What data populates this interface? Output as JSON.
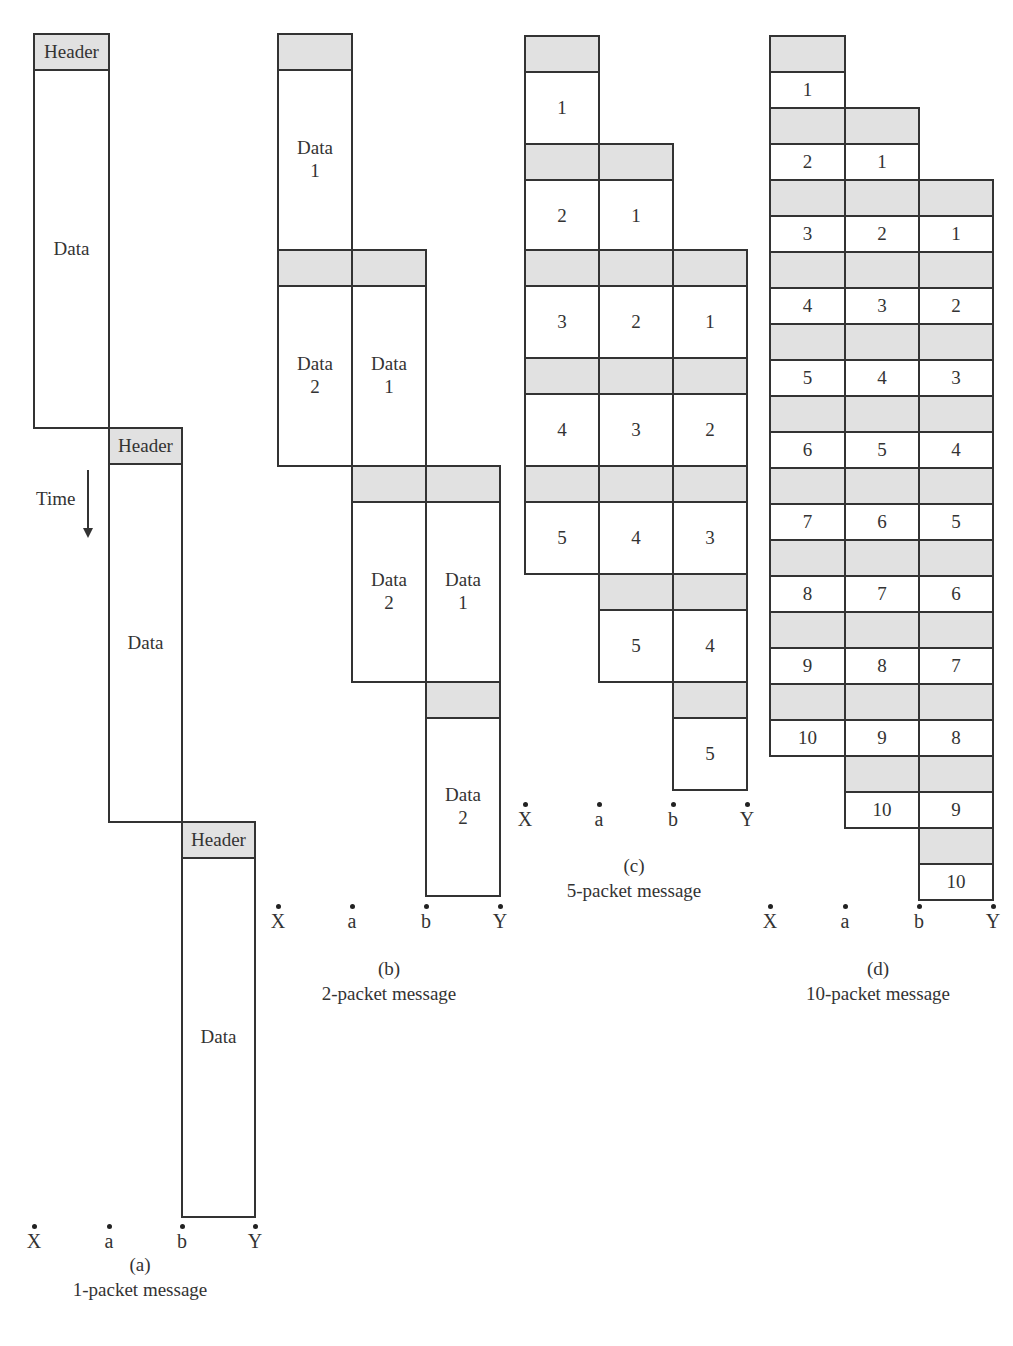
{
  "figure": {
    "colors": {
      "header_fill": "#e1e1e1",
      "data_fill": "#ffffff",
      "stroke": "#333333"
    },
    "time_label": "Time",
    "panels": [
      {
        "id": "a",
        "caption_letter": "(a)",
        "caption_text": "1-packet message",
        "nodes": [
          "X",
          "a",
          "b",
          "Y"
        ],
        "cols": [
          34,
          109,
          182,
          255
        ],
        "node_y": 1230,
        "caption_x": 40,
        "caption_w": 200,
        "caption_y": 1252,
        "cells": [
          {
            "c": 0,
            "y": 34,
            "h": 36,
            "type": "hdr",
            "text": "Header"
          },
          {
            "c": 0,
            "y": 70,
            "h": 358,
            "type": "dat",
            "text": "Data"
          },
          {
            "c": 1,
            "y": 428,
            "h": 36,
            "type": "hdr",
            "text": "Header"
          },
          {
            "c": 1,
            "y": 464,
            "h": 358,
            "type": "dat",
            "text": "Data"
          },
          {
            "c": 2,
            "y": 822,
            "h": 36,
            "type": "hdr",
            "text": "Header"
          },
          {
            "c": 2,
            "y": 858,
            "h": 359,
            "type": "dat",
            "text": "Data"
          }
        ]
      },
      {
        "id": "b",
        "caption_letter": "(b)",
        "caption_text": "2-packet message",
        "nodes": [
          "X",
          "a",
          "b",
          "Y"
        ],
        "cols": [
          278,
          352,
          426,
          500
        ],
        "node_y": 910,
        "caption_x": 289,
        "caption_w": 200,
        "caption_y": 956,
        "cells": [
          {
            "c": 0,
            "y": 34,
            "h": 36,
            "type": "hdr",
            "text": ""
          },
          {
            "c": 0,
            "y": 70,
            "h": 180,
            "type": "dat",
            "text": "Data\n1"
          },
          {
            "c": 0,
            "y": 250,
            "h": 36,
            "type": "hdr",
            "text": ""
          },
          {
            "c": 1,
            "y": 250,
            "h": 36,
            "type": "hdr",
            "text": ""
          },
          {
            "c": 0,
            "y": 286,
            "h": 180,
            "type": "dat",
            "text": "Data\n2"
          },
          {
            "c": 1,
            "y": 286,
            "h": 180,
            "type": "dat",
            "text": "Data\n1"
          },
          {
            "c": 1,
            "y": 466,
            "h": 36,
            "type": "hdr",
            "text": ""
          },
          {
            "c": 2,
            "y": 466,
            "h": 36,
            "type": "hdr",
            "text": ""
          },
          {
            "c": 1,
            "y": 502,
            "h": 180,
            "type": "dat",
            "text": "Data\n2"
          },
          {
            "c": 2,
            "y": 502,
            "h": 180,
            "type": "dat",
            "text": "Data\n1"
          },
          {
            "c": 2,
            "y": 682,
            "h": 36,
            "type": "hdr",
            "text": ""
          },
          {
            "c": 2,
            "y": 718,
            "h": 178,
            "type": "dat",
            "text": "Data\n2"
          }
        ]
      },
      {
        "id": "c",
        "caption_letter": "(c)",
        "caption_text": "5-packet message",
        "nodes": [
          "X",
          "a",
          "b",
          "Y"
        ],
        "cols": [
          525,
          599,
          673,
          747
        ],
        "node_y": 808,
        "caption_x": 534,
        "caption_w": 200,
        "caption_y": 853,
        "cells": [
          {
            "c": 0,
            "y": 36,
            "h": 36,
            "type": "hdr",
            "text": ""
          },
          {
            "c": 0,
            "y": 72,
            "h": 72,
            "type": "dat",
            "text": "1"
          },
          {
            "c": 0,
            "y": 144,
            "h": 36,
            "type": "hdr",
            "text": ""
          },
          {
            "c": 1,
            "y": 144,
            "h": 36,
            "type": "hdr",
            "text": ""
          },
          {
            "c": 0,
            "y": 180,
            "h": 72,
            "type": "dat",
            "text": "2"
          },
          {
            "c": 1,
            "y": 180,
            "h": 72,
            "type": "dat",
            "text": "1"
          },
          {
            "c": 0,
            "y": 250,
            "h": 36,
            "type": "hdr",
            "text": ""
          },
          {
            "c": 1,
            "y": 250,
            "h": 36,
            "type": "hdr",
            "text": ""
          },
          {
            "c": 2,
            "y": 250,
            "h": 36,
            "type": "hdr",
            "text": ""
          },
          {
            "c": 0,
            "y": 286,
            "h": 72,
            "type": "dat",
            "text": "3"
          },
          {
            "c": 1,
            "y": 286,
            "h": 72,
            "type": "dat",
            "text": "2"
          },
          {
            "c": 2,
            "y": 286,
            "h": 72,
            "type": "dat",
            "text": "1"
          },
          {
            "c": 0,
            "y": 358,
            "h": 36,
            "type": "hdr",
            "text": ""
          },
          {
            "c": 1,
            "y": 358,
            "h": 36,
            "type": "hdr",
            "text": ""
          },
          {
            "c": 2,
            "y": 358,
            "h": 36,
            "type": "hdr",
            "text": ""
          },
          {
            "c": 0,
            "y": 394,
            "h": 72,
            "type": "dat",
            "text": "4"
          },
          {
            "c": 1,
            "y": 394,
            "h": 72,
            "type": "dat",
            "text": "3"
          },
          {
            "c": 2,
            "y": 394,
            "h": 72,
            "type": "dat",
            "text": "2"
          },
          {
            "c": 0,
            "y": 466,
            "h": 36,
            "type": "hdr",
            "text": ""
          },
          {
            "c": 1,
            "y": 466,
            "h": 36,
            "type": "hdr",
            "text": ""
          },
          {
            "c": 2,
            "y": 466,
            "h": 36,
            "type": "hdr",
            "text": ""
          },
          {
            "c": 0,
            "y": 502,
            "h": 72,
            "type": "dat",
            "text": "5"
          },
          {
            "c": 1,
            "y": 502,
            "h": 72,
            "type": "dat",
            "text": "4"
          },
          {
            "c": 2,
            "y": 502,
            "h": 72,
            "type": "dat",
            "text": "3"
          },
          {
            "c": 1,
            "y": 574,
            "h": 36,
            "type": "hdr",
            "text": ""
          },
          {
            "c": 2,
            "y": 574,
            "h": 36,
            "type": "hdr",
            "text": ""
          },
          {
            "c": 1,
            "y": 610,
            "h": 72,
            "type": "dat",
            "text": "5"
          },
          {
            "c": 2,
            "y": 610,
            "h": 72,
            "type": "dat",
            "text": "4"
          },
          {
            "c": 2,
            "y": 682,
            "h": 36,
            "type": "hdr",
            "text": ""
          },
          {
            "c": 2,
            "y": 718,
            "h": 72,
            "type": "dat",
            "text": "5"
          }
        ]
      },
      {
        "id": "d",
        "caption_letter": "(d)",
        "caption_text": "10-packet message",
        "nodes": [
          "X",
          "a",
          "b",
          "Y"
        ],
        "cols": [
          770,
          845,
          919,
          993
        ],
        "node_y": 910,
        "caption_x": 778,
        "caption_w": 200,
        "caption_y": 956,
        "staircase": {
          "start_y": 36,
          "hdr_h": 36,
          "dat_h": 36,
          "packets": 10,
          "hops": 3
        }
      }
    ]
  }
}
